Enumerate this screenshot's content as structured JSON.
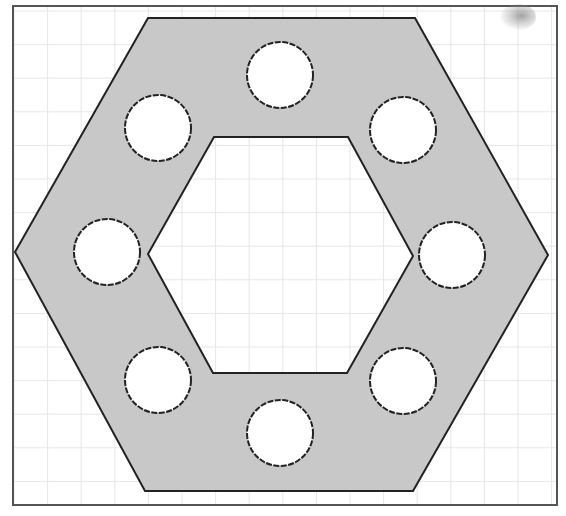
{
  "canvas": {
    "width": 566,
    "height": 516,
    "background": "#ffffff"
  },
  "frame": {
    "x": 13,
    "y": 6,
    "width": 544,
    "height": 499,
    "stroke": "#555555",
    "stroke_width": 2
  },
  "grid": {
    "color": "#e6e6e6",
    "spacing": 33.6,
    "origin_x": 14,
    "origin_y": 11
  },
  "diagram": {
    "fill": "#c8c8c8",
    "stroke": "#222222",
    "outer_hexagon": [
      [
        148,
        18
      ],
      [
        415,
        18
      ],
      [
        548,
        255
      ],
      [
        413,
        491
      ],
      [
        145,
        491
      ],
      [
        15,
        252
      ]
    ],
    "inner_hexagon": [
      [
        214,
        137
      ],
      [
        348,
        137
      ],
      [
        413,
        256
      ],
      [
        347,
        373
      ],
      [
        213,
        373
      ],
      [
        148,
        254
      ]
    ],
    "holes": [
      {
        "name": "hole-top",
        "cx": 280,
        "cy": 75,
        "r": 33
      },
      {
        "name": "hole-upper-left",
        "cx": 158,
        "cy": 128,
        "r": 33
      },
      {
        "name": "hole-upper-right",
        "cx": 403,
        "cy": 130,
        "r": 33
      },
      {
        "name": "hole-left",
        "cx": 107,
        "cy": 252,
        "r": 33
      },
      {
        "name": "hole-right",
        "cx": 452,
        "cy": 255,
        "r": 33
      },
      {
        "name": "hole-lower-left",
        "cx": 158,
        "cy": 380,
        "r": 33
      },
      {
        "name": "hole-lower-right",
        "cx": 403,
        "cy": 381,
        "r": 33
      },
      {
        "name": "hole-bottom",
        "cx": 280,
        "cy": 433,
        "r": 33
      }
    ]
  }
}
